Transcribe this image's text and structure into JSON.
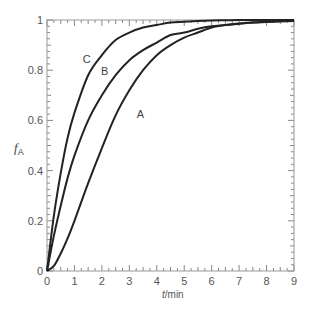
{
  "chart_data": {
    "type": "line",
    "title": "",
    "xlabel": "t/min",
    "ylabel": "fA",
    "xlim": [
      0,
      9
    ],
    "ylim": [
      0,
      1
    ],
    "xticks": [
      "0",
      "1",
      "2",
      "3",
      "4",
      "5",
      "6",
      "7",
      "8",
      "9"
    ],
    "yticks": [
      "0",
      "0.2",
      "0.4",
      "0.6",
      "0.8",
      "1"
    ],
    "grid": false,
    "legend": "inline curve labels",
    "x": [
      0,
      0.25,
      0.5,
      0.75,
      1,
      1.5,
      2,
      2.5,
      3,
      3.5,
      4,
      4.5,
      5,
      5.5,
      6,
      6.5,
      7,
      7.5,
      8,
      8.5,
      9
    ],
    "series": [
      {
        "name": "A",
        "values": [
          0,
          0.02,
          0.07,
          0.13,
          0.2,
          0.35,
          0.49,
          0.62,
          0.72,
          0.8,
          0.86,
          0.9,
          0.93,
          0.95,
          0.97,
          0.98,
          0.985,
          0.99,
          0.994,
          0.996,
          0.997
        ]
      },
      {
        "name": "B",
        "values": [
          0,
          0.14,
          0.26,
          0.37,
          0.46,
          0.6,
          0.7,
          0.78,
          0.84,
          0.88,
          0.91,
          0.94,
          0.95,
          0.965,
          0.975,
          0.98,
          0.986,
          0.99,
          0.992,
          0.994,
          0.996
        ]
      },
      {
        "name": "C",
        "values": [
          0,
          0.22,
          0.39,
          0.53,
          0.63,
          0.78,
          0.86,
          0.92,
          0.95,
          0.97,
          0.98,
          0.99,
          0.993,
          0.996,
          0.998,
          0.999,
          1,
          1,
          1,
          1,
          1
        ]
      }
    ],
    "annotations": [
      {
        "text": "C",
        "x": 1.45,
        "y": 0.83
      },
      {
        "text": "B",
        "x": 2.1,
        "y": 0.78
      },
      {
        "text": "A",
        "x": 3.4,
        "y": 0.61
      }
    ]
  },
  "labels": {
    "xlabel_t": "t",
    "xlabel_unit": "/min",
    "ylabel_f": "f",
    "ylabel_sub": "A"
  }
}
